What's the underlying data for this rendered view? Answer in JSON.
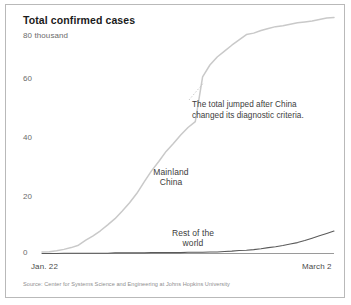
{
  "figure": {
    "title": "Total confirmed cases",
    "source": "Source: Center for Systems Science and Engineering at Johns Hopkins University",
    "colors": {
      "mainland_china_line": "#c9c9c9",
      "rest_of_world_line": "#5a5a5a",
      "axis": "#9a9a9a",
      "text": "#3c3c3c",
      "muted_text": "#6b6b6b",
      "frame": "#b9b9b9"
    }
  },
  "axes": {
    "y_ticks": [
      {
        "value": 80,
        "label": "80 thousand"
      },
      {
        "value": 60,
        "label": "60"
      },
      {
        "value": 40,
        "label": "40"
      },
      {
        "value": 20,
        "label": "20"
      },
      {
        "value": 0,
        "label": "0"
      }
    ],
    "x_ticks": [
      {
        "label": "Jan. 22"
      },
      {
        "label": "March 2"
      }
    ]
  },
  "annotations": {
    "jump_note": "The total jumped after China changed its diagnostic criteria.",
    "mainland_china_label": "Mainland\nChina",
    "rest_of_world_label": "Rest of the\nworld"
  },
  "chart_data": {
    "type": "line",
    "title": "Total confirmed cases",
    "xlabel": "",
    "ylabel": "Thousands of confirmed cases",
    "ylim": [
      0,
      85
    ],
    "yunit": "thousand",
    "grid": false,
    "legend": "inline-labels",
    "x": [
      "Jan. 22",
      "Jan. 23",
      "Jan. 24",
      "Jan. 25",
      "Jan. 26",
      "Jan. 27",
      "Jan. 28",
      "Jan. 29",
      "Jan. 30",
      "Jan. 31",
      "Feb. 1",
      "Feb. 2",
      "Feb. 3",
      "Feb. 4",
      "Feb. 5",
      "Feb. 6",
      "Feb. 7",
      "Feb. 8",
      "Feb. 9",
      "Feb. 10",
      "Feb. 11",
      "Feb. 12",
      "Feb. 13",
      "Feb. 14",
      "Feb. 15",
      "Feb. 16",
      "Feb. 17",
      "Feb. 18",
      "Feb. 19",
      "Feb. 20",
      "Feb. 21",
      "Feb. 22",
      "Feb. 23",
      "Feb. 24",
      "Feb. 25",
      "Feb. 26",
      "Feb. 27",
      "Feb. 28",
      "Feb. 29",
      "March 1",
      "March 2"
    ],
    "series": [
      {
        "name": "Mainland China",
        "color": "#c9c9c9",
        "values": [
          0.5,
          0.6,
          0.9,
          1.4,
          2.0,
          2.8,
          4.5,
          6.0,
          7.7,
          9.7,
          11.8,
          14.4,
          17.2,
          20.4,
          24.3,
          28.0,
          31.2,
          34.6,
          37.3,
          40.2,
          42.7,
          44.7,
          59.9,
          63.9,
          66.6,
          68.6,
          70.6,
          72.4,
          74.2,
          74.7,
          75.6,
          76.3,
          76.9,
          77.2,
          77.7,
          78.2,
          78.5,
          78.8,
          79.3,
          79.8,
          80.0
        ]
      },
      {
        "name": "Rest of the world",
        "color": "#5a5a5a",
        "values": [
          0.0,
          0.0,
          0.0,
          0.1,
          0.1,
          0.1,
          0.1,
          0.1,
          0.1,
          0.1,
          0.2,
          0.2,
          0.2,
          0.2,
          0.2,
          0.3,
          0.3,
          0.3,
          0.3,
          0.3,
          0.4,
          0.4,
          0.4,
          0.5,
          0.5,
          0.7,
          0.8,
          1.0,
          1.1,
          1.3,
          1.6,
          2.0,
          2.3,
          2.7,
          3.2,
          3.7,
          4.4,
          5.2,
          6.0,
          6.8,
          7.6
        ]
      }
    ],
    "callouts": [
      {
        "text": "The total jumped after China changed its diagnostic criteria.",
        "at_x": "Feb. 13",
        "about_series": "Mainland China"
      }
    ]
  }
}
